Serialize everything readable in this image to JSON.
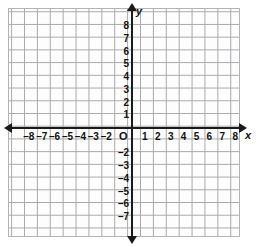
{
  "chart_data": {
    "type": "scatter",
    "title": "",
    "xlabel": "x",
    "ylabel": "y",
    "grid": true,
    "legend": null,
    "origin_label": "O",
    "xlim": [
      -9,
      9
    ],
    "ylim": [
      -9,
      9
    ],
    "x_tick_labels": [
      "–8",
      "–7",
      "–6",
      "–5",
      "–4",
      "–3",
      "–2",
      "1",
      "2",
      "3",
      "4",
      "5",
      "6",
      "7",
      "8"
    ],
    "x_tick_values": [
      -8,
      -7,
      -6,
      -5,
      -4,
      -3,
      -2,
      1,
      2,
      3,
      4,
      5,
      6,
      7,
      8
    ],
    "y_tick_labels": [
      "8",
      "7",
      "6",
      "5",
      "4",
      "3",
      "2",
      "1",
      "–2",
      "–3",
      "–4",
      "–5",
      "–6",
      "–7"
    ],
    "y_tick_values": [
      8,
      7,
      6,
      5,
      4,
      3,
      2,
      1,
      -2,
      -3,
      -4,
      -5,
      -6,
      -7
    ],
    "series": [],
    "annotations": [],
    "grid_step": 1,
    "colors": {
      "axis": "#1a1a1a",
      "grid": "#a9a9ad",
      "label": "#111111",
      "background": "#ffffff"
    }
  },
  "axes": {
    "x_name": "x",
    "y_name": "y",
    "origin": "O"
  }
}
